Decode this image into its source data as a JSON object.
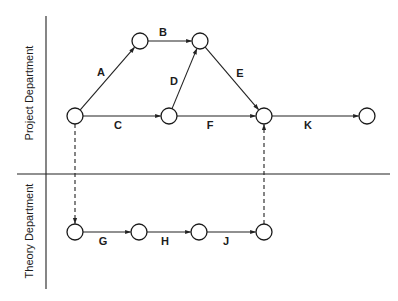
{
  "diagram": {
    "type": "activity-network",
    "swimlanes": [
      {
        "id": "project",
        "label": "Project Department",
        "label_x": 30,
        "label_y": 93
      },
      {
        "id": "theory",
        "label": "Theory Department",
        "label_x": 30,
        "label_y": 231
      }
    ],
    "dividers": {
      "vertical": {
        "x": 46,
        "y1": 16,
        "y2": 289
      },
      "horizontal": {
        "y": 174,
        "x1": 17,
        "x2": 390
      }
    },
    "nodes": [
      {
        "id": "n1",
        "lane": "project",
        "x": 75,
        "y": 116
      },
      {
        "id": "n2",
        "lane": "project",
        "x": 140,
        "y": 41
      },
      {
        "id": "n3",
        "lane": "project",
        "x": 200,
        "y": 41
      },
      {
        "id": "n4",
        "lane": "project",
        "x": 169,
        "y": 116
      },
      {
        "id": "n5",
        "lane": "project",
        "x": 264,
        "y": 116
      },
      {
        "id": "n6",
        "lane": "project",
        "x": 367,
        "y": 116
      },
      {
        "id": "t1",
        "lane": "theory",
        "x": 75,
        "y": 232
      },
      {
        "id": "t2",
        "lane": "theory",
        "x": 139,
        "y": 232
      },
      {
        "id": "t3",
        "lane": "theory",
        "x": 199,
        "y": 232
      },
      {
        "id": "t4",
        "lane": "theory",
        "x": 264,
        "y": 232
      }
    ],
    "node_radius": 8,
    "activities": [
      {
        "label": "A",
        "from": "n1",
        "to": "n2",
        "style": "solid",
        "label_x": 101,
        "label_y": 76
      },
      {
        "label": "B",
        "from": "n2",
        "to": "n3",
        "style": "solid",
        "label_x": 163,
        "label_y": 36
      },
      {
        "label": "C",
        "from": "n1",
        "to": "n4",
        "style": "solid",
        "label_x": 118,
        "label_y": 129
      },
      {
        "label": "D",
        "from": "n4",
        "to": "n3",
        "style": "solid",
        "label_x": 174,
        "label_y": 85
      },
      {
        "label": "E",
        "from": "n3",
        "to": "n5",
        "style": "solid",
        "label_x": 240,
        "label_y": 77
      },
      {
        "label": "F",
        "from": "n4",
        "to": "n5",
        "style": "solid",
        "label_x": 210,
        "label_y": 129
      },
      {
        "label": "K",
        "from": "n5",
        "to": "n6",
        "style": "solid",
        "label_x": 308,
        "label_y": 129
      },
      {
        "label": "G",
        "from": "t1",
        "to": "t2",
        "style": "solid",
        "label_x": 103,
        "label_y": 245
      },
      {
        "label": "H",
        "from": "t2",
        "to": "t3",
        "style": "solid",
        "label_x": 165,
        "label_y": 245
      },
      {
        "label": "J",
        "from": "t3",
        "to": "t4",
        "style": "solid",
        "label_x": 226,
        "label_y": 245
      }
    ],
    "dependencies": [
      {
        "from": "n1",
        "to": "t1",
        "style": "dashed"
      },
      {
        "from": "t4",
        "to": "n5",
        "style": "dashed"
      }
    ],
    "colors": {
      "stroke": "#222222",
      "background": "#ffffff"
    }
  }
}
